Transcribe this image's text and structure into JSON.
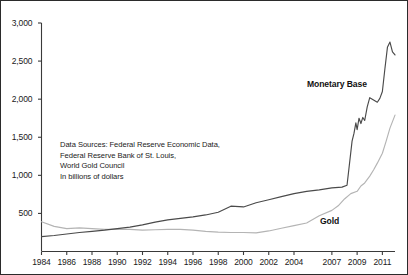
{
  "chart_data": {
    "type": "line",
    "title": "",
    "xlabel": "",
    "ylabel": "",
    "units_note": "In billions of dollars",
    "grid": false,
    "legend_position": "inline-annotations",
    "xlim": [
      1984,
      2012
    ],
    "ylim": [
      0,
      3000
    ],
    "y_ticks": [
      "500",
      "1,000",
      "1,500",
      "2,000",
      "2,500",
      "3,000"
    ],
    "y_tick_values": [
      500,
      1000,
      1500,
      2000,
      2500,
      3000
    ],
    "x_ticks": [
      "1984",
      "1986",
      "1988",
      "1990",
      "1992",
      "1994",
      "1996",
      "1998",
      "2000",
      "2002",
      "2004",
      "2007",
      "2009",
      "2011"
    ],
    "x_tick_values": [
      1984,
      1986,
      1988,
      1990,
      1992,
      1994,
      1996,
      1998,
      2000,
      2002,
      2004,
      2007,
      2009,
      2011
    ],
    "series": [
      {
        "name": "Monetary Base",
        "color": "#4a4a4a",
        "x": [
          1984,
          1985,
          1986,
          1987,
          1988,
          1989,
          1990,
          1991,
          1992,
          1993,
          1994,
          1995,
          1996,
          1997,
          1998,
          1999,
          2000,
          2001,
          2002,
          2003,
          2004,
          2005,
          2006,
          2007,
          2007.8,
          2008.2,
          2008.6,
          2008.75,
          2008.9,
          2009.0,
          2009.15,
          2009.3,
          2009.45,
          2009.6,
          2009.8,
          2010.0,
          2010.2,
          2010.4,
          2010.6,
          2010.8,
          2011.0,
          2011.2,
          2011.4,
          2011.6,
          2011.8,
          2012
        ],
        "values": [
          195,
          210,
          230,
          250,
          265,
          280,
          300,
          320,
          350,
          385,
          415,
          435,
          455,
          480,
          515,
          595,
          585,
          640,
          680,
          720,
          760,
          790,
          810,
          835,
          845,
          870,
          1450,
          1550,
          1690,
          1600,
          1750,
          1680,
          1760,
          1720,
          1900,
          2020,
          2000,
          1980,
          1960,
          2010,
          2100,
          2400,
          2680,
          2750,
          2620,
          2580
        ]
      },
      {
        "name": "Gold",
        "color": "#b4b4b4",
        "x": [
          1984,
          1985,
          1986,
          1987,
          1988,
          1989,
          1990,
          1991,
          1992,
          1993,
          1994,
          1995,
          1996,
          1997,
          1998,
          1999,
          2000,
          2001,
          2002,
          2003,
          2004,
          2005,
          2006,
          2007,
          2007.5,
          2008,
          2008.5,
          2009,
          2009.3,
          2009.6,
          2010,
          2010.3,
          2010.6,
          2011,
          2011.3,
          2011.6,
          2012
        ],
        "values": [
          390,
          330,
          300,
          310,
          300,
          290,
          290,
          290,
          280,
          285,
          290,
          290,
          280,
          265,
          255,
          250,
          250,
          245,
          270,
          305,
          340,
          375,
          470,
          540,
          600,
          690,
          760,
          790,
          860,
          900,
          990,
          1070,
          1160,
          1290,
          1450,
          1620,
          1790
        ]
      }
    ],
    "annotations": [
      {
        "text": "Monetary Base",
        "x": 2008.2,
        "y": 2150,
        "bold": true
      },
      {
        "text": "Gold",
        "x": 2009.6,
        "y": 330,
        "bold": true
      }
    ],
    "source_note": "Data Sources: Federal Reserve Economic Data,\nFederal Reserve Bank of St. Louis,\nWorld Gold Council\nIn billions of dollars"
  },
  "figure": {
    "border_color": "#2b2b2b",
    "background": "#ffffff",
    "axis_color": "#3a3a3a"
  }
}
